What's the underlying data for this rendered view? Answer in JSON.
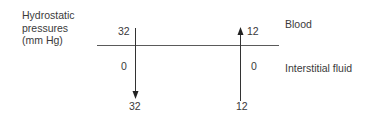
{
  "diagram": {
    "title_lines": [
      "Hydrostatic",
      "pressures",
      "(mm Hg)"
    ],
    "compartments": {
      "top": "Blood",
      "bottom": "Interstitial fluid"
    },
    "left_column": {
      "blood_value": "32",
      "interstitial_value": "0",
      "net_value": "32",
      "arrow_direction": "down"
    },
    "right_column": {
      "blood_value": "12",
      "interstitial_value": "0",
      "net_value": "12",
      "arrow_direction": "up"
    },
    "colors": {
      "line": "#4a4a4a",
      "text": "#3a3a3a"
    }
  }
}
